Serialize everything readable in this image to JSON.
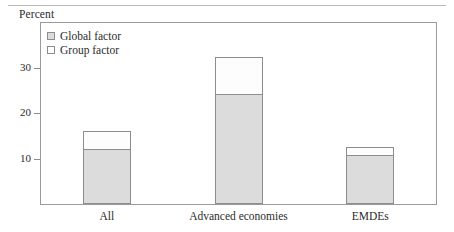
{
  "figure": {
    "unit_label": "Percent"
  },
  "legend": {
    "items": [
      {
        "label": "Global factor",
        "swatch": "gray-filled-square",
        "color": "#dcdcdc"
      },
      {
        "label": "Group factor",
        "swatch": "white-empty-square",
        "color": "#ffffff"
      }
    ]
  },
  "chart_data": {
    "type": "bar",
    "stacked": true,
    "title": "",
    "subtitle": "",
    "xlabel": "",
    "ylabel": "Percent",
    "categories": [
      "All",
      "Advanced economies",
      "EMDEs"
    ],
    "series": [
      {
        "name": "Global factor",
        "values": [
          12.0,
          24.1,
          10.7
        ],
        "color": "#dcdcdc"
      },
      {
        "name": "Group factor",
        "values": [
          4.0,
          8.2,
          1.9
        ],
        "color": "#ffffff"
      }
    ],
    "totals": [
      16.0,
      32.3,
      12.6
    ],
    "ylim": [
      0,
      39.8
    ],
    "yticks": [
      10,
      20,
      30
    ],
    "ytick_labels": [
      "10",
      "20",
      "30"
    ],
    "grid": false,
    "legend_position": "top-left",
    "annotations": []
  }
}
